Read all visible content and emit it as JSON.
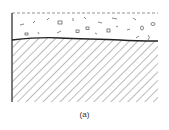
{
  "figure": {
    "caption": "(a)",
    "regions": [
      {
        "name": "granular-layer",
        "description": "loose particles above interface"
      },
      {
        "name": "solid-substrate",
        "description": "hatched solid region below interface"
      }
    ],
    "colors": {
      "line": "#222222",
      "hatch": "#555555",
      "dash": "#777777"
    }
  }
}
